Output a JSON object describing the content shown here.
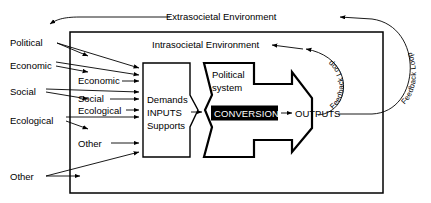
{
  "diagram": {
    "environments": {
      "outer_label": "Extrasocietal Environment",
      "inner_label": "Intrasocietal Environment"
    },
    "outer_inputs": [
      {
        "label": "Political"
      },
      {
        "label": "Economic"
      },
      {
        "label": "Social"
      },
      {
        "label": "Ecological"
      },
      {
        "label": "Other"
      }
    ],
    "inner_inputs": [
      {
        "label": "Economic"
      },
      {
        "label": "Social"
      },
      {
        "label": "Ecological"
      },
      {
        "label": "Other"
      }
    ],
    "inputs_box": {
      "line1": "Demands",
      "line2": "INPUTS",
      "line3": "Supports"
    },
    "system_box": {
      "line1": "Political",
      "line2": "system"
    },
    "conversion_label": "CONVERSION",
    "outputs_label": "OUTPUTS",
    "feedback_inner": "Feedback Loop",
    "feedback_outer": "Feedback Loop",
    "colors": {
      "stroke": "#000000",
      "background": "#ffffff",
      "conversion_fill": "#000000",
      "conversion_text": "#ffffff"
    }
  }
}
